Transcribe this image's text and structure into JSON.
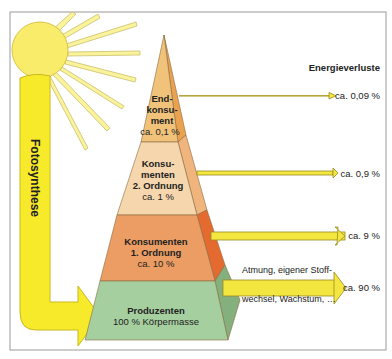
{
  "title": "Energieverluste",
  "photosynthesis_label": "Fotosynthese",
  "levels": [
    {
      "name_lines": [
        "End-",
        "konsu-",
        "ment"
      ],
      "value": "ca. 0,1 %",
      "color": "#f1c27a",
      "side_color": "#eaa24f"
    },
    {
      "name_lines": [
        "Konsu-",
        "menten",
        "2. Ordnung"
      ],
      "value": "ca. 1 %",
      "color": "#f6d6ac",
      "side_color": "#efb57c"
    },
    {
      "name_lines": [
        "Konsumenten",
        "1. Ordnung"
      ],
      "value": "ca. 10 %",
      "color": "#ec9d63",
      "side_color": "#e46a2f"
    },
    {
      "name_lines": [
        "Produzenten"
      ],
      "value": "100 % Körpermasse",
      "color": "#a6cf9f",
      "side_color": "#84b07d"
    }
  ],
  "losses": [
    {
      "value": "ca. 0,09 %"
    },
    {
      "value": "ca. 0,9 %"
    },
    {
      "value": "ca. 9 %"
    },
    {
      "value": "ca. 90 %",
      "note_top": "Atmung, eigener Stoff-",
      "note_bottom": "wechsel, Wachstum, …"
    }
  ],
  "colors": {
    "sun": "#f9ec6a",
    "arrow_yellow": "#f7ea2a",
    "frame": "#999999"
  }
}
